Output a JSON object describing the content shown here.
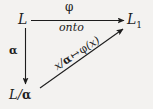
{
  "figure": {
    "type": "commutative-diagram",
    "background_color": "#f3f2f0",
    "ink_color": "#1d1d1d",
    "nodes": [
      {
        "id": "source",
        "label": "L",
        "position": "top-left"
      },
      {
        "id": "target",
        "label": "L",
        "subscript": "1",
        "position": "top-right"
      },
      {
        "id": "quotient",
        "label": "L/",
        "alpha": "α",
        "position": "bottom-left"
      }
    ],
    "edges": [
      {
        "id": "horizontal",
        "from": "source",
        "to": "target",
        "label_above": "φ",
        "label_below": "onto",
        "style": "solid-with-arrowhead"
      },
      {
        "id": "vertical",
        "from": "source",
        "to": "quotient",
        "label": "α",
        "style": "solid-with-arrowhead"
      },
      {
        "id": "diagonal",
        "from": "quotient",
        "to": "target",
        "label_prefix": "x/",
        "label_alpha": "α",
        "label_mapsto": "↦",
        "label_phi": "φ",
        "label_suffix": "(x)",
        "style": "solid-with-arrowhead"
      }
    ]
  }
}
